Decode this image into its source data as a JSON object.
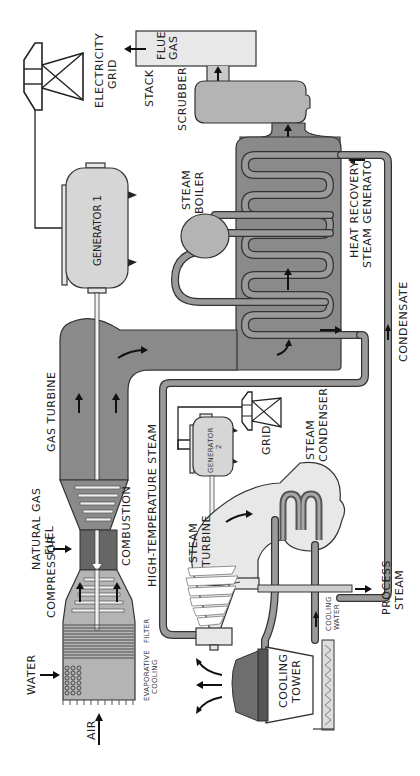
{
  "diagram": {
    "orientation": "rotated-90-ccw",
    "labels": {
      "electricity_grid_1": "ELECTRICITY",
      "electricity_grid_2": "GRID",
      "stack": "STACK",
      "flue_gas_1": "FLUE",
      "flue_gas_2": "GAS",
      "scrubber": "SCRUBBER",
      "generator1": "GENERATOR 1",
      "steam_boiler_1": "STEAM",
      "steam_boiler_2": "BOILER",
      "hrsg_1": "HEAT RECOVERY",
      "hrsg_2": "STEAM GENERATOR",
      "condensate": "CONDENSATE",
      "gas_turbine": "GAS TURBINE",
      "natural_gas_1": "NATURAL GAS",
      "natural_gas_2": "FUEL",
      "combustion": "COMBUSTION",
      "high_temp_steam": "HIGH-TEMPERATURE STEAM",
      "generator2_1": "GENERATOR",
      "generator2_2": "2",
      "grid": "GRID",
      "steam_condenser_1": "STEAM",
      "steam_condenser_2": "CONDENSER",
      "compressor": "COMPRESSOR",
      "steam_turbine_1": "STEAM",
      "steam_turbine_2": "TURBINE",
      "water": "WATER",
      "filter": "FILTER",
      "evaporative_cooling_1": "EVAPORATIVE",
      "evaporative_cooling_2": "COOLING",
      "air": "AIR",
      "cooling_tower_1": "COOLING",
      "cooling_tower_2": "TOWER",
      "cooling_water_1": "COOLING",
      "cooling_water_2": "WATER",
      "process_steam_1": "PROCESS",
      "process_steam_2": "STEAM"
    },
    "colors": {
      "dark_gray": "#8a8a8a",
      "mid_gray": "#b4b4b4",
      "light_gray": "#d6d6d6",
      "outline": "#333333"
    }
  }
}
